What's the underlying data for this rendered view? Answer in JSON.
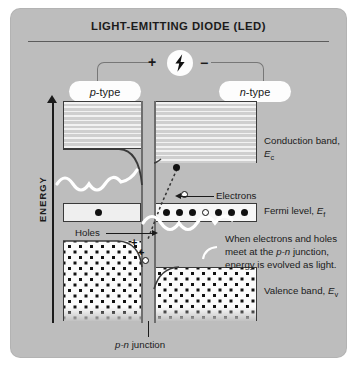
{
  "title": "LIGHT-EMITTING DIODE (LED)",
  "circuit": {
    "bolt_icon": "lightning-bolt-icon",
    "positive_terminal": "+",
    "negative_terminal": "−",
    "p_side_label": "p",
    "p_side_suffix": "-type",
    "n_side_label": "n",
    "n_side_suffix": "-type"
  },
  "axis": {
    "energy_label": "ENERGY"
  },
  "labels": {
    "conduction_band_line1": "Conduction band,",
    "conduction_band_symbol": "E",
    "conduction_band_sub": "c",
    "fermi_level": "Fermi level, ",
    "fermi_symbol": "E",
    "fermi_sub": "f",
    "valence_band": "Valence band, ",
    "valence_symbol": "E",
    "valence_sub": "v",
    "electrons": "Electrons",
    "holes": "Holes",
    "pn_junction_italic": "p-n",
    "pn_junction_rest": " junction",
    "explanation_line1": "When electrons and holes",
    "explanation_line2a": "meet at the ",
    "explanation_line2b": "p-n",
    "explanation_line2c": " junction,",
    "explanation_line3": "energy is evolved as light."
  },
  "colors": {
    "panel_background": "#bdbdbd",
    "band_outline": "#3a3a3a",
    "photon_wave": "#ffffff",
    "carrier_dot": "#111111",
    "pill_background": "#fdfdfd"
  }
}
